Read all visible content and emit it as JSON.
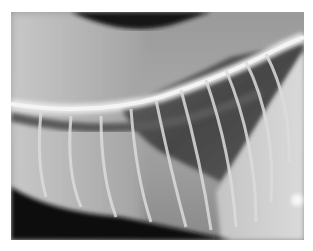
{
  "image": {
    "subject": "lateral thoracic radiograph",
    "description": "Grayscale X-ray showing spine, rib cage, lung field and diaphragm",
    "colors": {
      "background": "#ffffff",
      "soft_tissue": "#a4a4a4",
      "bone": "#e8e8e8",
      "lung_dark": "#404040",
      "air_black": "#0c0c0c",
      "bright_tissue": "#d6d6d6"
    }
  }
}
